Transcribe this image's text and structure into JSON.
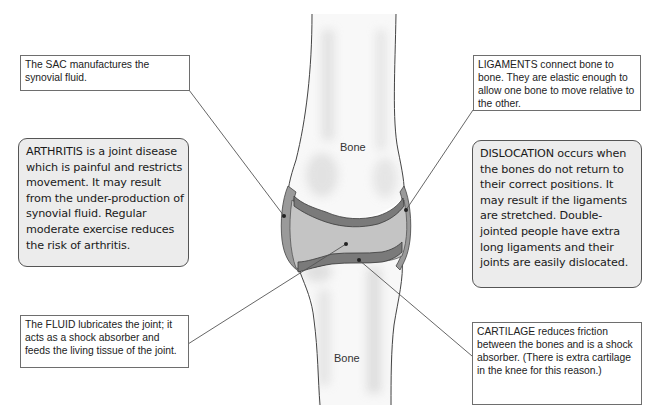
{
  "diagram": {
    "bone_labels": {
      "upper": "Bone",
      "lower": "Bone"
    },
    "colors": {
      "background": "#ffffff",
      "callout_box_fill": "#ffffff",
      "info_box_fill": "#ececec",
      "box_border": "#6e6e6e",
      "bone_fill": "#f7f7f7",
      "bone_shading": "#dcdcdc",
      "cartilage": "#7a7a7a",
      "synovial_fluid": "#c4c4c4",
      "sac_ligament": "#9a9a9a",
      "leader_line": "#555555"
    }
  },
  "callouts": {
    "sac": {
      "text": "The SAC manufactures the synovial fluid."
    },
    "fluid": {
      "text": "The FLUID lubricates the joint; it acts as a shock absorber and feeds the living tissue of the joint."
    },
    "ligaments": {
      "text": "LIGAMENTS connect bone to bone. They are elastic enough to allow one bone to move relative to the other."
    },
    "cartilage": {
      "text": "CARTILAGE reduces friction between the bones and is a shock absorber. (There is extra cartilage in the knee for this reason.)"
    }
  },
  "info_boxes": {
    "arthritis": {
      "text": "ARTHRITIS is a joint disease which is painful and restricts movement. It may result from the under-production of synovial fluid. Regular moderate exercise  reduces the risk of arthritis."
    },
    "dislocation": {
      "text": "DISLOCATION occurs when the bones do not return to their correct positions. It may result if the ligaments are stretched. Double-jointed people have extra long ligaments and their joints are easily dislocated."
    }
  }
}
